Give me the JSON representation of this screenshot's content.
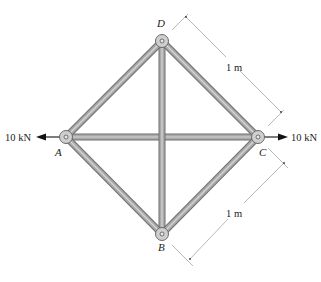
{
  "figure": {
    "type": "truss",
    "nodes": [
      {
        "id": "A",
        "label": "A",
        "x": 66,
        "y": 137,
        "label_x": 55,
        "label_y": 156
      },
      {
        "id": "B",
        "label": "B",
        "x": 162,
        "y": 234,
        "label_x": 158,
        "label_y": 251
      },
      {
        "id": "C",
        "label": "C",
        "x": 258,
        "y": 137,
        "label_x": 259,
        "label_y": 156
      },
      {
        "id": "D",
        "label": "D",
        "x": 162,
        "y": 41,
        "label_x": 157,
        "label_y": 27
      }
    ],
    "members": [
      {
        "from": "A",
        "to": "D"
      },
      {
        "from": "D",
        "to": "C"
      },
      {
        "from": "A",
        "to": "B"
      },
      {
        "from": "B",
        "to": "C"
      },
      {
        "from": "A",
        "to": "C"
      },
      {
        "from": "D",
        "to": "B"
      }
    ],
    "loads": [
      {
        "node": "A",
        "label": "10 kN",
        "magnitude": 10,
        "unit": "kN",
        "direction": "left"
      },
      {
        "node": "C",
        "label": "10 kN",
        "magnitude": 10,
        "unit": "kN",
        "direction": "right"
      }
    ],
    "dimensions": [
      {
        "between": [
          "D",
          "C"
        ],
        "label": "1 m"
      },
      {
        "between": [
          "C",
          "B"
        ],
        "label": "1 m"
      }
    ],
    "colors": {
      "member_fill": "#a9a9a9",
      "member_edge": "#6f6f6f",
      "member_highlight": "#d6d6d6",
      "joint_fill": "#cfcfcf",
      "joint_edge": "#6a6a6a",
      "dimension_line": "#9a9a9a",
      "arrow": "#111111",
      "text": "#222222"
    }
  }
}
